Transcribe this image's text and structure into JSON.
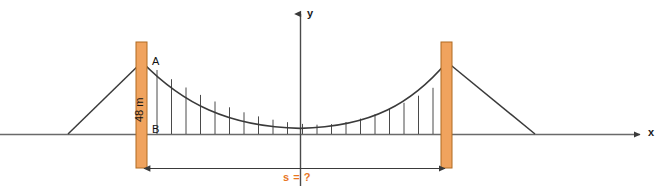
{
  "figure": {
    "colors": {
      "tower_fill": "#f0a35e",
      "tower_edge": "#b06a20",
      "cable": "#3a3a3a",
      "axis": "#555555",
      "hanger": "#4a4a4a",
      "span_label": "#e8761f",
      "background": "#ffffff"
    }
  },
  "axes": {
    "x_label": "x",
    "y_label": "y",
    "x_axis_y": 134,
    "y_axis_x": 300,
    "x_start": 0,
    "x_end": 646,
    "y_top": 8,
    "y_bottom": 186
  },
  "points": {
    "a_label": "A",
    "a_x": 152,
    "a_y": 62,
    "b_label": "B",
    "b_x": 152,
    "b_y": 134
  },
  "measurements": {
    "height_label": "48 m",
    "span_label": "s = ?"
  },
  "towers": [
    {
      "name": "left-tower",
      "x": 136,
      "y": 42,
      "width": 11,
      "height": 126
    },
    {
      "name": "right-tower",
      "x": 441,
      "y": 42,
      "width": 11,
      "height": 126
    }
  ],
  "main_cable": {
    "left_top_x": 142,
    "left_top_y": 62,
    "right_top_x": 447,
    "right_top_y": 62,
    "vertex_x": 300,
    "vertex_y": 128
  },
  "anchor_cables": [
    {
      "name": "left-anchor-cable",
      "x1": 142,
      "y1": 62,
      "x2": 68,
      "y2": 134
    },
    {
      "name": "right-anchor-cable",
      "x1": 447,
      "y1": 62,
      "x2": 535,
      "y2": 134
    }
  ],
  "hangers": {
    "count": 20,
    "start_x": 157,
    "end_x": 433
  },
  "span_dimension": {
    "y": 168,
    "x1": 143,
    "x2": 446,
    "label_x": 300,
    "label_y": 176
  }
}
